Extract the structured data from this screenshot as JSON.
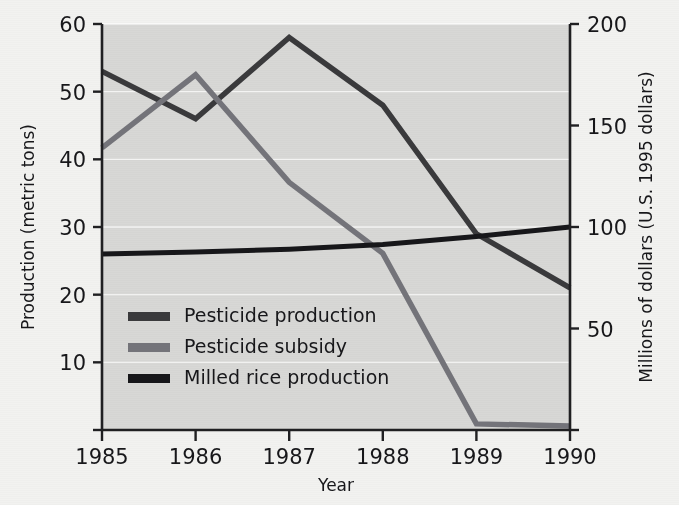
{
  "chart_data": {
    "type": "line",
    "title": "",
    "xlabel": "Year",
    "ylabel": "Production (metric tons)",
    "y2label": "Millions of dollars (U.S. 1995 dollars)",
    "x": [
      1985,
      1986,
      1987,
      1988,
      1989,
      1990
    ],
    "xtick_labels": [
      "1985",
      "1986",
      "1987",
      "1988",
      "1989",
      "1990"
    ],
    "xlim": [
      1985,
      1990
    ],
    "ylim": [
      0,
      60
    ],
    "ytick_labels": [
      "10",
      "20",
      "30",
      "40",
      "50",
      "60"
    ],
    "yticks": [
      10,
      20,
      30,
      40,
      50,
      60
    ],
    "y2lim": [
      0,
      200
    ],
    "y2tick_labels": [
      "50",
      "100",
      "150",
      "200"
    ],
    "y2ticks": [
      50,
      100,
      150,
      200
    ],
    "grid": true,
    "grid_axis": "y",
    "legend_position": "inside lower left",
    "series": [
      {
        "name": "Pesticide production",
        "axis": "left",
        "units": "metric tons",
        "color": "#3a3a3c",
        "values": [
          53,
          46,
          58,
          48,
          29,
          21
        ]
      },
      {
        "name": "Pesticide subsidy",
        "axis": "right",
        "units": "millions of U.S. 1995 dollars",
        "color": "#74747a",
        "values": [
          139,
          175,
          122,
          87,
          3,
          2
        ],
        "values_left_axis_equivalent": [
          41.7,
          52.5,
          36.5,
          26,
          0.9,
          0.6
        ]
      },
      {
        "name": "Milled rice production",
        "axis": "left",
        "units": "metric tons",
        "color": "#17171a",
        "values": [
          26,
          26.3,
          26.7,
          27.4,
          28.6,
          30
        ]
      }
    ]
  },
  "legend": {
    "entries": [
      {
        "label": "Pesticide production",
        "swatch_color": "#3a3a3c"
      },
      {
        "label": "Pesticide subsidy",
        "swatch_color": "#74747a"
      },
      {
        "label": "Milled rice production",
        "swatch_color": "#17171a"
      }
    ]
  },
  "colors": {
    "plot_background": "#d8d8d6",
    "page_background": "#f2f2f0",
    "axis": "#202022",
    "gridline": "#ffffff",
    "pesticide_production": "#3a3a3c",
    "pesticide_subsidy": "#74747a",
    "milled_rice_production": "#17171a"
  }
}
